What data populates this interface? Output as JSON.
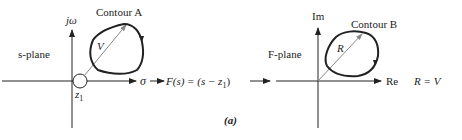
{
  "figure": {
    "caption": "(a)",
    "left_plane": {
      "plane_label": "s-plane",
      "vertical_axis_label": "jω",
      "horizontal_axis_label": "σ",
      "contour_label": "Contour A",
      "vector_label": "V",
      "zero_label": "z",
      "zero_subscript": "1"
    },
    "mapping": {
      "function_label_prefix": "F(s) = (s − z",
      "function_label_subscript": "1",
      "function_label_suffix": ")"
    },
    "right_plane": {
      "plane_label": "F-plane",
      "vertical_axis_label": "Im",
      "horizontal_axis_label": "Re",
      "contour_label": "Contour B",
      "vector_label": "R",
      "equation": "R = V"
    },
    "colors": {
      "line": "#222222",
      "vector": "#888888",
      "background": "#ffffff"
    }
  }
}
